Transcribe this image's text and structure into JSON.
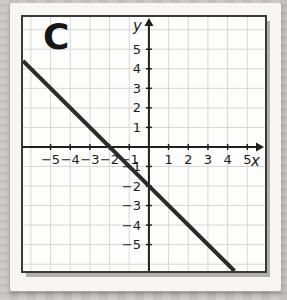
{
  "page": {
    "background_color": "#c6c5c3",
    "card_color": "#f7f6f3"
  },
  "chart_data": {
    "type": "line",
    "title": "C",
    "xlabel": "x",
    "ylabel": "y",
    "xlim": [
      -6.4,
      5.9
    ],
    "ylim": [
      -6.35,
      6.65
    ],
    "grid": true,
    "x_ticks": {
      "values": [
        -5,
        -4,
        -3,
        -2,
        -1,
        1,
        2,
        3,
        4,
        5
      ],
      "labels": [
        "−5",
        "−4",
        "−3",
        "−2",
        "−1",
        "1",
        "2",
        "3",
        "4",
        "5"
      ]
    },
    "y_ticks": {
      "values": [
        -5,
        -4,
        -3,
        -2,
        -1,
        1,
        2,
        3,
        4,
        5
      ],
      "labels": [
        "−5",
        "−4",
        "−3",
        "−2",
        "−1",
        "1",
        "2",
        "3",
        "4",
        "5"
      ]
    },
    "series": [
      {
        "name": "C",
        "slope": -1,
        "y_intercept": -2,
        "x_intercept": -2,
        "points_on_line": [
          [
            -2,
            0
          ],
          [
            0,
            -2
          ]
        ],
        "endpoints": [
          [
            -6.4,
            4.4
          ],
          [
            4.35,
            -6.35
          ]
        ],
        "color": "#2b2b2b",
        "stroke_width": 4
      }
    ],
    "colors": {
      "grid": "#d6d7d9",
      "axis": "#1f1f1f",
      "tick_label": "#1c1c1c",
      "plot_background": "#fdfdfc",
      "plot_border": "#3a3a38"
    }
  }
}
